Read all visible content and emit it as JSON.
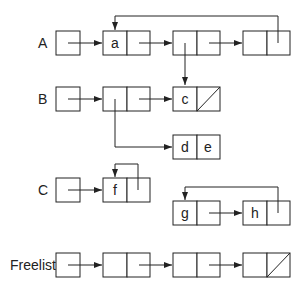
{
  "diagram": {
    "rows": [
      {
        "label": "A",
        "nodes": [
          {
            "car": "a",
            "cdr": ""
          },
          {
            "car": "",
            "cdr": ""
          },
          {
            "car": "",
            "cdr": ""
          }
        ]
      },
      {
        "label": "B",
        "nodes": [
          {
            "car": "",
            "cdr": ""
          },
          {
            "car": "c",
            "cdr": "nil"
          }
        ]
      },
      {
        "label": "",
        "nodes": [
          {
            "car": "d",
            "cdr": "e"
          }
        ]
      },
      {
        "label": "C",
        "nodes": [
          {
            "car": "f",
            "cdr": ""
          }
        ]
      },
      {
        "label": "",
        "nodes": [
          {
            "car": "g",
            "cdr": ""
          },
          {
            "car": "h",
            "cdr": ""
          }
        ]
      },
      {
        "label": "Freelist",
        "nodes": [
          {
            "car": "",
            "cdr": ""
          },
          {
            "car": "",
            "cdr": ""
          },
          {
            "car": "",
            "cdr": "nil"
          }
        ]
      }
    ],
    "labels": {
      "A": "A",
      "B": "B",
      "C": "C",
      "freelist": "Freelist"
    },
    "cells": {
      "a": "a",
      "c": "c",
      "d": "d",
      "e": "e",
      "f": "f",
      "g": "g",
      "h": "h"
    },
    "colors": {
      "stroke": "#222222",
      "background": "#ffffff"
    }
  }
}
